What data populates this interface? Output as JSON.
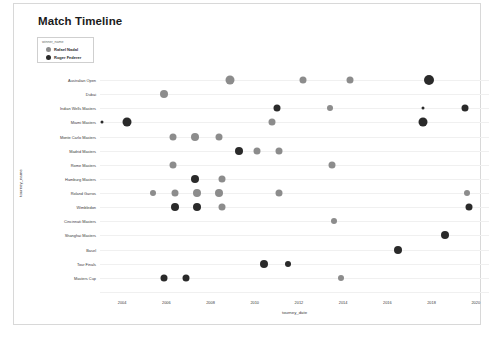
{
  "card": {
    "title": "Match Timeline"
  },
  "legend": {
    "title": "winner_name",
    "entries": [
      {
        "label": "Rafael Nadal",
        "color": "#8c8c8c",
        "icon": "circle-marker-icon"
      },
      {
        "label": "Roger Federer",
        "color": "#2a2a2a",
        "icon": "circle-marker-icon"
      }
    ]
  },
  "chart_data": {
    "type": "scatter",
    "title": "Match Timeline",
    "xlabel": "tourney_date",
    "ylabel": "tourney_name",
    "grid": true,
    "legend_position": "top-left",
    "xlim": [
      2003.0,
      2020.6
    ],
    "xticks": [
      "2004",
      "2006",
      "2008",
      "2010",
      "2012",
      "2014",
      "2016",
      "2018",
      "2020"
    ],
    "xtick_values": [
      2004,
      2006,
      2008,
      2010,
      2012,
      2014,
      2016,
      2018,
      2020
    ],
    "categories": [
      "Australian Open",
      "Dubai",
      "Indian Wells Masters",
      "Miami Masters",
      "Monte Carlo Masters",
      "Madrid Masters",
      "Rome Masters",
      "Hamburg Masters",
      "Roland Garros",
      "Wimbledon",
      "Cincinnati Masters",
      "Shanghai Masters",
      "Basel",
      "Tour Finals",
      "Masters Cup"
    ],
    "series": [
      {
        "name": "Rafael Nadal",
        "color": "#8c8c8c",
        "points": [
          {
            "x": 2008.9,
            "y": "Australian Open",
            "size": 9
          },
          {
            "x": 2012.2,
            "y": "Australian Open",
            "size": 7
          },
          {
            "x": 2014.3,
            "y": "Australian Open",
            "size": 7
          },
          {
            "x": 2005.9,
            "y": "Dubai",
            "size": 8
          },
          {
            "x": 2013.4,
            "y": "Indian Wells Masters",
            "size": 6
          },
          {
            "x": 2010.8,
            "y": "Miami Masters",
            "size": 7
          },
          {
            "x": 2006.3,
            "y": "Monte Carlo Masters",
            "size": 7
          },
          {
            "x": 2007.3,
            "y": "Monte Carlo Masters",
            "size": 8
          },
          {
            "x": 2008.4,
            "y": "Monte Carlo Masters",
            "size": 7
          },
          {
            "x": 2010.1,
            "y": "Madrid Masters",
            "size": 7
          },
          {
            "x": 2011.1,
            "y": "Madrid Masters",
            "size": 7
          },
          {
            "x": 2006.3,
            "y": "Rome Masters",
            "size": 7
          },
          {
            "x": 2013.5,
            "y": "Rome Masters",
            "size": 7
          },
          {
            "x": 2008.5,
            "y": "Hamburg Masters",
            "size": 7
          },
          {
            "x": 2005.4,
            "y": "Roland Garros",
            "size": 6
          },
          {
            "x": 2006.4,
            "y": "Roland Garros",
            "size": 7
          },
          {
            "x": 2007.4,
            "y": "Roland Garros",
            "size": 8
          },
          {
            "x": 2008.4,
            "y": "Roland Garros",
            "size": 8
          },
          {
            "x": 2011.1,
            "y": "Roland Garros",
            "size": 7
          },
          {
            "x": 2019.6,
            "y": "Roland Garros",
            "size": 6
          },
          {
            "x": 2008.5,
            "y": "Wimbledon",
            "size": 7
          },
          {
            "x": 2013.6,
            "y": "Cincinnati Masters",
            "size": 6
          },
          {
            "x": 2013.9,
            "y": "Masters Cup",
            "size": 6
          }
        ]
      },
      {
        "name": "Roger Federer",
        "color": "#2a2a2a",
        "points": [
          {
            "x": 2017.9,
            "y": "Australian Open",
            "size": 10
          },
          {
            "x": 2011.0,
            "y": "Indian Wells Masters",
            "size": 7
          },
          {
            "x": 2017.6,
            "y": "Indian Wells Masters",
            "size": 3
          },
          {
            "x": 2019.5,
            "y": "Indian Wells Masters",
            "size": 7
          },
          {
            "x": 2003.1,
            "y": "Miami Masters",
            "size": 3
          },
          {
            "x": 2004.2,
            "y": "Miami Masters",
            "size": 9
          },
          {
            "x": 2017.6,
            "y": "Miami Masters",
            "size": 9
          },
          {
            "x": 2009.3,
            "y": "Madrid Masters",
            "size": 8
          },
          {
            "x": 2007.3,
            "y": "Hamburg Masters",
            "size": 8
          },
          {
            "x": 2006.4,
            "y": "Wimbledon",
            "size": 8
          },
          {
            "x": 2007.4,
            "y": "Wimbledon",
            "size": 8
          },
          {
            "x": 2019.7,
            "y": "Wimbledon",
            "size": 7
          },
          {
            "x": 2018.6,
            "y": "Shanghai Masters",
            "size": 8
          },
          {
            "x": 2016.5,
            "y": "Basel",
            "size": 8
          },
          {
            "x": 2010.4,
            "y": "Tour Finals",
            "size": 8
          },
          {
            "x": 2011.5,
            "y": "Tour Finals",
            "size": 6
          },
          {
            "x": 2005.9,
            "y": "Masters Cup",
            "size": 7
          },
          {
            "x": 2006.9,
            "y": "Masters Cup",
            "size": 7
          }
        ]
      }
    ]
  }
}
